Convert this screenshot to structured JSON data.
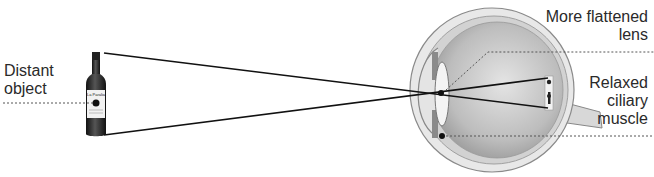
{
  "diagram": {
    "labels": {
      "distant_object": [
        "Distant",
        "object"
      ],
      "lens": [
        "More flattened",
        "lens"
      ],
      "muscle": [
        "Relaxed",
        "ciliary",
        "muscle"
      ]
    },
    "bottle_label": "La Paralia",
    "colors": {
      "text": "#2a2a2a",
      "rays": "#111111",
      "eye_outer": "#cfcfcf",
      "eye_inner": "#b5b5b5",
      "leader": "#555555"
    }
  }
}
